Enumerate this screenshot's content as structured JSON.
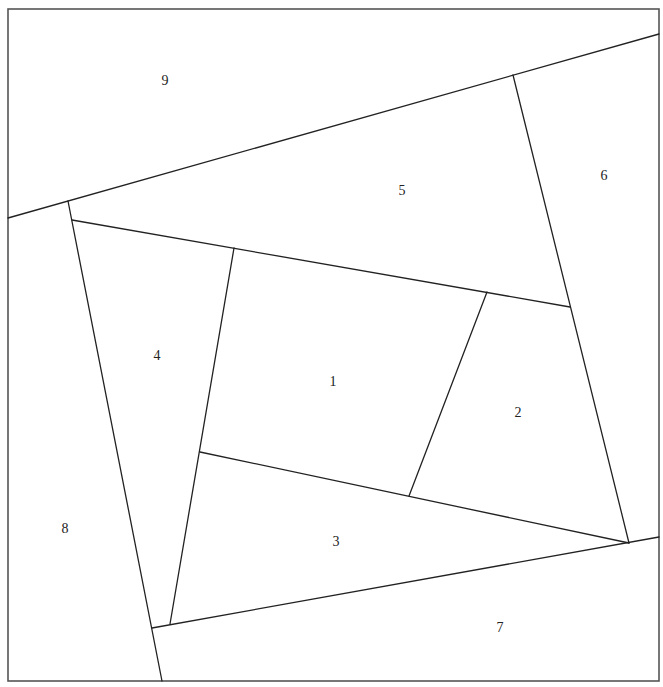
{
  "diagram": {
    "type": "quilt-block-piecing-layout",
    "width": 663,
    "height": 687,
    "frame": {
      "x": 8,
      "y": 9,
      "width": 651,
      "height": 672
    },
    "line_color": "#222222",
    "frame_color": "#555555",
    "background": "#ffffff",
    "edges": [
      {
        "id": "e9-top-diagonal",
        "x1": 8,
        "y1": 218,
        "x2": 659,
        "y2": 34
      },
      {
        "id": "e8-left-slant",
        "x1": 68,
        "y1": 201,
        "x2": 162,
        "y2": 681
      },
      {
        "id": "e6-right-slant",
        "x1": 513,
        "y1": 75,
        "x2": 629,
        "y2": 543
      },
      {
        "id": "e7-bottom-rise",
        "x1": 152,
        "y1": 628,
        "x2": 659,
        "y2": 537
      },
      {
        "id": "e5-lower-edge",
        "x1": 72,
        "y1": 220,
        "x2": 570,
        "y2": 307
      },
      {
        "id": "e4-inner-slant",
        "x1": 234,
        "y1": 248,
        "x2": 170,
        "y2": 624
      },
      {
        "id": "e3-upper-edge",
        "x1": 200,
        "y1": 452,
        "x2": 629,
        "y2": 543
      },
      {
        "id": "e2-left-slant",
        "x1": 487,
        "y1": 292,
        "x2": 409,
        "y2": 496
      }
    ],
    "labels": [
      {
        "id": "1",
        "text": "1",
        "x": 333,
        "y": 383
      },
      {
        "id": "2",
        "text": "2",
        "x": 518,
        "y": 414
      },
      {
        "id": "3",
        "text": "3",
        "x": 336,
        "y": 543
      },
      {
        "id": "4",
        "text": "4",
        "x": 157,
        "y": 357
      },
      {
        "id": "5",
        "text": "5",
        "x": 402,
        "y": 192
      },
      {
        "id": "6",
        "text": "6",
        "x": 604,
        "y": 177
      },
      {
        "id": "7",
        "text": "7",
        "x": 500,
        "y": 629
      },
      {
        "id": "8",
        "text": "8",
        "x": 65,
        "y": 530
      },
      {
        "id": "9",
        "text": "9",
        "x": 165,
        "y": 82
      }
    ]
  }
}
